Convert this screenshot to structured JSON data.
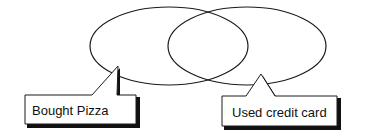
{
  "diagram": {
    "type": "venn",
    "sets": [
      {
        "id": "pizza",
        "label": "Bought Pizza"
      },
      {
        "id": "credit",
        "label": "Used credit card"
      }
    ],
    "colors": {
      "stroke": "#1a1a1a",
      "fill": "#ffffff",
      "shadow": "#111111"
    }
  }
}
